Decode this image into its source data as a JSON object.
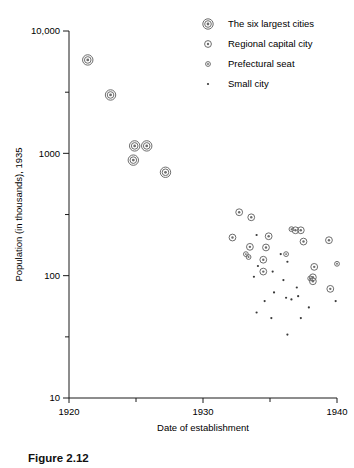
{
  "caption": "Figure 2.12",
  "chart_data": {
    "type": "scatter",
    "title": "",
    "xlabel": "Date of establishment",
    "ylabel": "Population (in thousands), 1935",
    "xlim": [
      1920,
      1940
    ],
    "ylim": [
      10,
      10000
    ],
    "yscale": "log",
    "xscale": "linear",
    "grid": false,
    "xticks": [
      1920,
      1930,
      1940
    ],
    "xticklabels": [
      "1920",
      "1930",
      "1940"
    ],
    "xminorticks": [
      1925,
      1935
    ],
    "yticks": [
      10,
      100,
      1000,
      10000
    ],
    "yticklabels": [
      "10",
      "100",
      "1000",
      "10,000"
    ],
    "yminorticks": [
      31.6,
      316,
      3160
    ],
    "legend_position": "top-right",
    "series": [
      {
        "name": "The six largest cities",
        "marker": "double-circle-large",
        "points": [
          {
            "x": 1921.4,
            "y": 5800
          },
          {
            "x": 1923.1,
            "y": 3000
          },
          {
            "x": 1924.9,
            "y": 1150
          },
          {
            "x": 1925.8,
            "y": 1150
          },
          {
            "x": 1924.8,
            "y": 880
          },
          {
            "x": 1927.2,
            "y": 700
          }
        ]
      },
      {
        "name": "Regional capital city",
        "marker": "circle-medium",
        "points": [
          {
            "x": 1932.7,
            "y": 330
          },
          {
            "x": 1933.6,
            "y": 300
          },
          {
            "x": 1932.2,
            "y": 205
          },
          {
            "x": 1934.9,
            "y": 210
          },
          {
            "x": 1936.9,
            "y": 235
          },
          {
            "x": 1937.3,
            "y": 235
          },
          {
            "x": 1937.5,
            "y": 190
          },
          {
            "x": 1939.4,
            "y": 195
          },
          {
            "x": 1933.5,
            "y": 172
          },
          {
            "x": 1934.7,
            "y": 170
          },
          {
            "x": 1934.5,
            "y": 135
          },
          {
            "x": 1934.5,
            "y": 108
          },
          {
            "x": 1938.3,
            "y": 118
          },
          {
            "x": 1938.2,
            "y": 97
          },
          {
            "x": 1938.2,
            "y": 90
          },
          {
            "x": 1939.5,
            "y": 78
          }
        ]
      },
      {
        "name": "Prefectural seat",
        "marker": "circle-small",
        "points": [
          {
            "x": 1933.2,
            "y": 150
          },
          {
            "x": 1933.4,
            "y": 142
          },
          {
            "x": 1936.6,
            "y": 240
          },
          {
            "x": 1936.2,
            "y": 150
          },
          {
            "x": 1940.0,
            "y": 125
          },
          {
            "x": 1938.0,
            "y": 95
          }
        ]
      },
      {
        "name": "Small city",
        "marker": "dot",
        "points": [
          {
            "x": 1934.0,
            "y": 215
          },
          {
            "x": 1935.8,
            "y": 150
          },
          {
            "x": 1936.3,
            "y": 130
          },
          {
            "x": 1934.1,
            "y": 120
          },
          {
            "x": 1935.2,
            "y": 108
          },
          {
            "x": 1933.8,
            "y": 98
          },
          {
            "x": 1936.0,
            "y": 92
          },
          {
            "x": 1937.0,
            "y": 80
          },
          {
            "x": 1935.3,
            "y": 73
          },
          {
            "x": 1936.2,
            "y": 66
          },
          {
            "x": 1936.6,
            "y": 64
          },
          {
            "x": 1937.1,
            "y": 68
          },
          {
            "x": 1934.6,
            "y": 62
          },
          {
            "x": 1939.9,
            "y": 62
          },
          {
            "x": 1935.1,
            "y": 45
          },
          {
            "x": 1937.3,
            "y": 45
          },
          {
            "x": 1936.3,
            "y": 33
          },
          {
            "x": 1934.0,
            "y": 50
          },
          {
            "x": 1937.9,
            "y": 55
          }
        ]
      }
    ]
  },
  "legend": {
    "items": [
      {
        "label": "The six largest cities",
        "marker": "double-circle-large"
      },
      {
        "label": "Regional capital city",
        "marker": "circle-medium"
      },
      {
        "label": "Prefectural seat",
        "marker": "circle-small"
      },
      {
        "label": "Small city",
        "marker": "dot"
      }
    ]
  }
}
